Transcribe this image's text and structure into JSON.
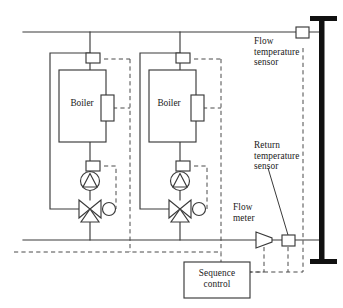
{
  "diagram": {
    "canvas": {
      "width": 343,
      "height": 308
    },
    "colors": {
      "pipe": "#3a3a3a",
      "control_wiring": "#4a4a4a",
      "header_bar": "#111111",
      "background": "#ffffff",
      "text": "#1a1a1a"
    },
    "labels": {
      "flow_temperature_sensor": "Flow\ntemperature\nsensor",
      "return_temperature_sensor": "Return\ntemperature\nsensor",
      "flow_meter": "Flow\nmeter",
      "sequence_control": "Sequence\ncontrol"
    },
    "boilers": [
      {
        "label": "Boiler",
        "index": 1
      },
      {
        "label": "Boiler",
        "index": 2
      }
    ],
    "components": [
      {
        "name": "flow-header-pipe",
        "type": "pipe"
      },
      {
        "name": "return-header-pipe",
        "type": "pipe"
      },
      {
        "name": "distribution-header",
        "type": "i-beam"
      },
      {
        "name": "boiler-vessel",
        "type": "rectangle",
        "count": 2
      },
      {
        "name": "boiler-controller",
        "type": "rectangle",
        "count": 2
      },
      {
        "name": "boiler-flow-sensor",
        "type": "small-rectangle",
        "count": 2
      },
      {
        "name": "boiler-return-sensor",
        "type": "small-rectangle",
        "count": 2
      },
      {
        "name": "circulation-pump",
        "type": "circle-triangle",
        "count": 2
      },
      {
        "name": "three-way-mixing-valve",
        "type": "bowtie-valve",
        "count": 2
      },
      {
        "name": "valve-actuator",
        "type": "circle",
        "count": 2
      },
      {
        "name": "bypass-line",
        "type": "pipe",
        "count": 2
      },
      {
        "name": "flow-meter",
        "type": "cone",
        "count": 1
      },
      {
        "name": "return-temperature-sensor",
        "type": "small-rectangle",
        "count": 1
      },
      {
        "name": "flow-temperature-sensor",
        "type": "small-rectangle",
        "count": 1
      },
      {
        "name": "sequence-control-unit",
        "type": "rectangle",
        "count": 1
      }
    ]
  }
}
